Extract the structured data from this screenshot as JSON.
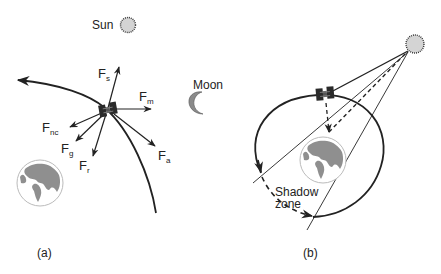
{
  "panel_a": {
    "label": "(a)",
    "sun_label": "Sun",
    "moon_label": "Moon",
    "forces": [
      {
        "id": "s",
        "main": "F",
        "sub": "s"
      },
      {
        "id": "m",
        "main": "F",
        "sub": "m"
      },
      {
        "id": "nc",
        "main": "F",
        "sub": "nc"
      },
      {
        "id": "g",
        "main": "F",
        "sub": "g"
      },
      {
        "id": "r",
        "main": "F",
        "sub": "r"
      },
      {
        "id": "a",
        "main": "F",
        "sub": "a"
      }
    ]
  },
  "panel_b": {
    "label": "(b)",
    "shadow_label_line1": "Shadow",
    "shadow_label_line2": "zone"
  },
  "colors": {
    "line": "#222222",
    "sun_fill": "#d4d4d4",
    "moon_fill": "#8a8a8a",
    "earth_land": "#8f8f8f",
    "earth_ocean": "#ffffff",
    "satellite": "#2a2a2a"
  }
}
